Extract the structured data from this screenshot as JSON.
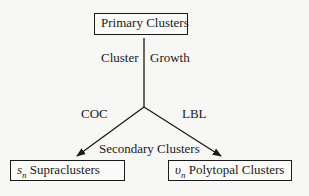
{
  "diagram": {
    "top_node": "Primary Clusters",
    "left_node": {
      "symbol": "s",
      "subscript": "n",
      "label": "Supraclusters"
    },
    "right_node": {
      "symbol": "υ",
      "subscript": "n",
      "label": "Polytopal Clusters"
    },
    "stem_label_left": "Cluster",
    "stem_label_right": "Growth",
    "branch_left_label": "COC",
    "branch_right_label": "LBL",
    "middle_label": "Secondary Clusters"
  }
}
